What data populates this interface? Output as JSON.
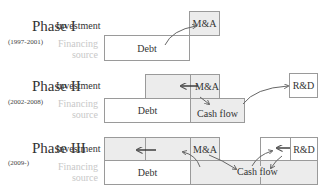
{
  "phases": [
    {
      "name": "Phase I",
      "years": "(1997-2001)"
    },
    {
      "name": "Phase II",
      "years": "(2002-2008)"
    },
    {
      "name": "Phase III",
      "years": "(2009-)"
    }
  ],
  "row_labels": {
    "investment": "Investment",
    "financing_line1": "Financing",
    "financing_line2": "source"
  },
  "boxes": {
    "debt": "Debt",
    "ma": "M&A",
    "cash_flow": "Cash flow",
    "rd": "R&D"
  },
  "colors": {
    "border": "#9a9a9a",
    "shaded": "#ececec",
    "arrow": "#555555",
    "financing_label": "#c8c8c8"
  }
}
